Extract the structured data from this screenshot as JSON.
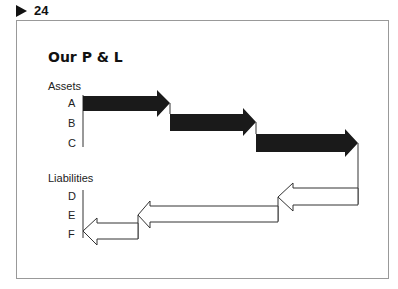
{
  "page": {
    "number": "24",
    "marker_icon": "triangle-right"
  },
  "diagram": {
    "title": "Our P & L",
    "assets": {
      "heading": "Assets",
      "rows": [
        "A",
        "B",
        "C"
      ]
    },
    "liabilities": {
      "heading": "Liabilities",
      "rows": [
        "D",
        "E",
        "F"
      ]
    },
    "colors": {
      "asset_fill": "#1a1a1a",
      "liability_fill": "#ffffff",
      "stroke": "#333333",
      "border": "#999999"
    }
  }
}
